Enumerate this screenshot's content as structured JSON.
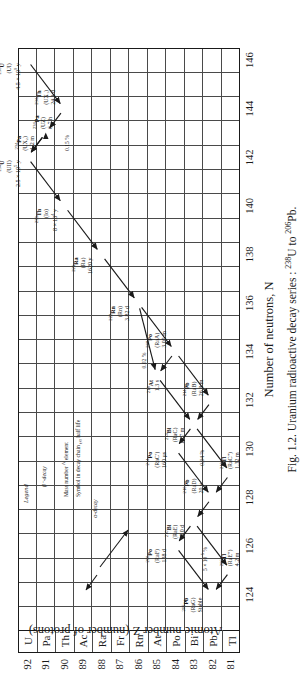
{
  "figure": {
    "caption": "Fig. 1.2. Uranium radioactive decay series : 238U to 206Pb.",
    "caption_prefix": "Fig. 1.2. Uranium radioactive decay series : ",
    "caption_mid": "U to ",
    "caption_end": "Pb.",
    "caption_sup1": "238",
    "caption_sup2": "206"
  },
  "axes": {
    "y_label": "Atomic number Z (number of protons)",
    "x_label": "Number of neutrons, N",
    "x_ticks": [
      124,
      126,
      128,
      130,
      132,
      134,
      136,
      138,
      140,
      142,
      144,
      146
    ],
    "x_min": 123,
    "x_max": 147,
    "y_rows": [
      {
        "z": 92,
        "symbol": "U"
      },
      {
        "z": 91,
        "symbol": "Pa"
      },
      {
        "z": 90,
        "symbol": "Th"
      },
      {
        "z": 89,
        "symbol": "Ac"
      },
      {
        "z": 88,
        "symbol": "Ra"
      },
      {
        "z": 87,
        "symbol": "Fr"
      },
      {
        "z": 86,
        "symbol": "Rn"
      },
      {
        "z": 85,
        "symbol": "At"
      },
      {
        "z": 84,
        "symbol": "Po"
      },
      {
        "z": 83,
        "symbol": "Bi"
      },
      {
        "z": 82,
        "symbol": "Pb"
      },
      {
        "z": 81,
        "symbol": "Tl"
      }
    ]
  },
  "legend": {
    "title": "Legend",
    "beta_label": "β⁻-decay",
    "alpha_label": "α-decay",
    "line1": "Mass number  A    element",
    "line2": "Symbol in decay chain  t½  half life",
    "mass_number_text": "Mass number",
    "mass_number_sup": "A",
    "element_text": "element",
    "symbol_text": "Symbol in decay chain",
    "halflife_sub": "t½",
    "halflife_text": "half life"
  },
  "chart_data": {
    "type": "scatter",
    "xlabel": "Number of neutrons, N",
    "ylabel": "Atomic number Z (number of protons)",
    "xlim": [
      123,
      147
    ],
    "ylim": [
      80.5,
      92.5
    ],
    "grid": true,
    "nuclides": [
      {
        "id": "U238",
        "A": "238",
        "element": "U",
        "Z": 92,
        "N": 146,
        "chain_symbol": "(UI)",
        "half_life": "4.5 × 10⁹ y",
        "hl_mant": "4.5 × 10",
        "hl_exp": "9",
        "hl_unit": " y"
      },
      {
        "id": "Th234",
        "A": "234",
        "element": "Th",
        "Z": 90,
        "N": 144,
        "chain_symbol": "(UX₁)",
        "half_life": "24.1 d"
      },
      {
        "id": "Pa234m",
        "A": "234",
        "element": "Pa",
        "Z": 91,
        "N": 143,
        "chain_symbol": "(UX₂)",
        "half_life": "1.2 m"
      },
      {
        "id": "Pa234",
        "A": "234",
        "element": "Pa",
        "Z": 91,
        "N": 143,
        "chain_symbol": "(UZ)",
        "half_life": "6.7 h"
      },
      {
        "id": "U234",
        "A": "234",
        "element": "U",
        "Z": 92,
        "N": 142,
        "chain_symbol": "(UII)",
        "half_life": "2.5 × 10⁵ y",
        "hl_mant": "2.5 × 10",
        "hl_exp": "5",
        "hl_unit": " y"
      },
      {
        "id": "Th230",
        "A": "230",
        "element": "Th",
        "Z": 90,
        "N": 140,
        "chain_symbol": "(Io)",
        "half_life": "8 × 10⁴ y",
        "hl_mant": "8 × 10",
        "hl_exp": "4",
        "hl_unit": " y"
      },
      {
        "id": "Ra226",
        "A": "226",
        "element": "Ra",
        "Z": 88,
        "N": 138,
        "chain_symbol": "(Ra)",
        "half_life": "1620 y"
      },
      {
        "id": "Rn222",
        "A": "222",
        "element": "Rn",
        "Z": 86,
        "N": 136,
        "chain_symbol": "(Rn)",
        "half_life": "3.82 d"
      },
      {
        "id": "At218",
        "A": "218",
        "element": "At",
        "Z": 85,
        "N": 133,
        "chain_symbol": "",
        "half_life": "1.3 s"
      },
      {
        "id": "Po218",
        "A": "218",
        "element": "Po",
        "Z": 84,
        "N": 134,
        "chain_symbol": "(RaA)",
        "half_life": "3.05 m"
      },
      {
        "id": "Pb214",
        "A": "214",
        "element": "Pb",
        "Z": 82,
        "N": 132,
        "chain_symbol": "(RaB)",
        "half_life": "26.8 m"
      },
      {
        "id": "Bi214",
        "A": "214",
        "element": "Bi",
        "Z": 83,
        "N": 131,
        "chain_symbol": "(RaC)",
        "half_life": "19.7 m"
      },
      {
        "id": "Po214",
        "A": "214",
        "element": "Po",
        "Z": 84,
        "N": 130,
        "chain_symbol": "(RaC′)",
        "half_life": "160 µs"
      },
      {
        "id": "Tl210",
        "A": "210",
        "element": "Tl",
        "Z": 81,
        "N": 129,
        "chain_symbol": "(RaC″)",
        "half_life": "1.32 m"
      },
      {
        "id": "Pb210",
        "A": "210",
        "element": "Pb",
        "Z": 82,
        "N": 128,
        "chain_symbol": "(RaD)",
        "half_life": "20 y"
      },
      {
        "id": "Bi210",
        "A": "210",
        "element": "Bi",
        "Z": 83,
        "N": 127,
        "chain_symbol": "(RaE)",
        "half_life": "5.0 d"
      },
      {
        "id": "Po210",
        "A": "210",
        "element": "Po",
        "Z": 84,
        "N": 126,
        "chain_symbol": "(RaF)",
        "half_life": "138 d"
      },
      {
        "id": "Tl206",
        "A": "206",
        "element": "Tl",
        "Z": 81,
        "N": 125,
        "chain_symbol": "(RaE″)",
        "half_life": "4.2 m"
      },
      {
        "id": "Pb206",
        "A": "206",
        "element": "Pb",
        "Z": 82,
        "N": 124,
        "chain_symbol": "(RaG)",
        "half_life": "Stable"
      }
    ],
    "branch_labels": [
      {
        "id": "b1",
        "text": "0.15 %",
        "note": "UX2 → UZ branch"
      },
      {
        "id": "b2",
        "text": "0.02 %",
        "note": "Rn222 → At218 branch"
      },
      {
        "id": "b3",
        "text": "0.04 %",
        "note": "Bi214 → Tl210 branch"
      },
      {
        "id": "b4",
        "text": "5 × 10⁻⁵ %",
        "mant": "5 × 10",
        "exp": "-5",
        "suffix": " %",
        "note": "Bi210 → Tl206 branch"
      }
    ]
  }
}
